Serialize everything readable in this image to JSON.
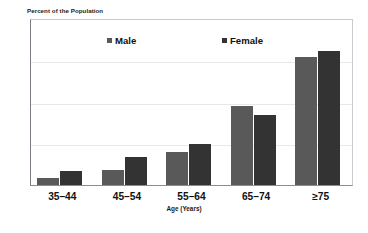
{
  "chart_data": {
    "type": "bar",
    "title": "",
    "ylabel": "Percent of the Population",
    "xlabel": "Age (Years)",
    "categories": [
      "35–44",
      "45–54",
      "55–64",
      "65–74",
      "≥75"
    ],
    "series": [
      {
        "name": "Male",
        "color": "#595959",
        "values": [
          0.7,
          1.4,
          3.2,
          7.6,
          12.3
        ]
      },
      {
        "name": "Female",
        "color": "#333333",
        "values": [
          1.3,
          2.7,
          3.9,
          6.7,
          12.8
        ]
      }
    ],
    "ylim": [
      0,
      16
    ],
    "yticks": [
      "0",
      "4",
      "8",
      "12",
      "16"
    ],
    "ytick_values": [
      0,
      4,
      8,
      12,
      16
    ],
    "grid": true,
    "legend_position": "top-inside"
  },
  "legend": {
    "male_label": "Male",
    "female_label": "Female"
  },
  "axes": {
    "y_title": "Percent of the Population",
    "x_title": "Age (Years)",
    "ytick_0": "0",
    "ytick_1": "4",
    "ytick_2": "8",
    "ytick_3": "12",
    "ytick_4": "16"
  },
  "categories": {
    "c0": "35–44",
    "c1": "45–54",
    "c2": "55–64",
    "c3": "65–74",
    "c4": "≥75"
  }
}
